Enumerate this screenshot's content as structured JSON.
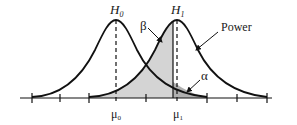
{
  "diagram": {
    "labels": {
      "h0": "H",
      "h0_sub": "0",
      "h1": "H",
      "h1_sub": "1",
      "beta": "β",
      "alpha": "α",
      "power": "Power",
      "mu0": "μ",
      "mu0_sub": "0",
      "mu1": "μ",
      "mu1_sub": "1"
    },
    "colors": {
      "curve": "#111111",
      "beta_fill": "#d4d4d4",
      "alpha_fill": "#b0b0b0",
      "background": "#ffffff"
    },
    "distributions": [
      {
        "name": "H0",
        "mean_label": "μ0",
        "peak_x": 116
      },
      {
        "name": "H1",
        "mean_label": "μ1",
        "peak_x": 177
      }
    ],
    "regions": [
      {
        "name": "beta",
        "description": "area under H1 left of critical value"
      },
      {
        "name": "alpha",
        "description": "area under H0 right of critical value"
      },
      {
        "name": "power",
        "description": "area under H1 right of critical value"
      }
    ]
  }
}
